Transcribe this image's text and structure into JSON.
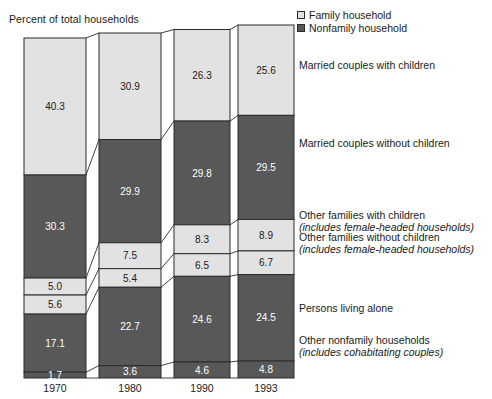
{
  "axis_title": "Percent of total households",
  "legend": {
    "items": [
      {
        "label": "Family household",
        "swatch": "light-swatch-icon",
        "color": "#e2e2e2"
      },
      {
        "label": "Nonfamily household",
        "swatch": "dark-swatch-icon",
        "color": "#585858"
      }
    ]
  },
  "side_labels": [
    {
      "title": "Married couples with children",
      "sub": ""
    },
    {
      "title": "Married couples without children",
      "sub": ""
    },
    {
      "title": "Other families with children",
      "sub": "(includes female-headed households)"
    },
    {
      "title": "Other families without children",
      "sub": "(includes female-headed households)"
    },
    {
      "title": "Persons living alone",
      "sub": ""
    },
    {
      "title": "Other nonfamily households",
      "sub": "(includes cohabitating couples)"
    }
  ],
  "colors": {
    "family": "#e2e2e2",
    "nonfamily": "#585858",
    "outline": "#2b2b2b",
    "background": "#ffffff"
  },
  "chart_data": {
    "type": "bar",
    "title": "",
    "subtitle": "",
    "xlabel": "",
    "ylabel": "Percent of total households",
    "ylim": [
      0,
      100
    ],
    "grid": false,
    "stacked": true,
    "normalized_percent": true,
    "legend_position": "top-right",
    "categories": [
      "1970",
      "1980",
      "1990",
      "1993"
    ],
    "series": [
      {
        "name": "Married couples with children",
        "household_type": "Family household",
        "fill": "light",
        "values": [
          40.3,
          30.9,
          26.3,
          25.6
        ]
      },
      {
        "name": "Married couples without children",
        "household_type": "Family household",
        "fill": "dark",
        "values": [
          30.3,
          29.9,
          29.8,
          29.5
        ]
      },
      {
        "name": "Other families with children",
        "household_type": "Family household",
        "fill": "light",
        "values": [
          5.0,
          7.5,
          8.3,
          8.9
        ]
      },
      {
        "name": "Other families without children",
        "household_type": "Family household",
        "fill": "light",
        "values": [
          5.6,
          5.4,
          6.5,
          6.7
        ]
      },
      {
        "name": "Persons living alone",
        "household_type": "Nonfamily household",
        "fill": "dark",
        "values": [
          17.1,
          22.7,
          24.6,
          24.5
        ]
      },
      {
        "name": "Other nonfamily households",
        "household_type": "Nonfamily household",
        "fill": "dark",
        "values": [
          1.7,
          3.6,
          4.6,
          4.8
        ]
      }
    ]
  }
}
